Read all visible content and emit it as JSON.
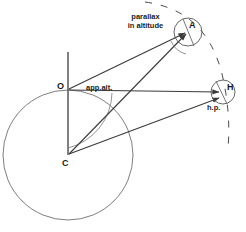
{
  "figure": {
    "background_color": "#ffffff",
    "stroke_color": "#3a3a3a",
    "circle_color": "#6b6b6b",
    "text_color": "#1a1a1a",
    "width": 246,
    "height": 232
  },
  "points": [
    {
      "id": "O",
      "label": "O",
      "x": 68,
      "y": 90,
      "label_x": 58,
      "label_y": 84,
      "description": "observer on earth surface"
    },
    {
      "id": "C",
      "label": "C",
      "x": 68,
      "y": 155,
      "label_x": 63,
      "label_y": 160,
      "description": "centre of the earth"
    },
    {
      "id": "A",
      "label": "A",
      "x": 188,
      "y": 32,
      "label_x": 190,
      "label_y": 22,
      "description": "body at apparent altitude"
    },
    {
      "id": "H",
      "label": "H",
      "x": 223,
      "y": 92,
      "label_x": 227,
      "label_y": 84,
      "description": "body on the horizon"
    }
  ],
  "annotations": [
    {
      "id": "parallax-in-altitude",
      "text_line_1": "parallax",
      "text_line_2": "in altitude",
      "x": 118,
      "y": 14,
      "width": 52
    },
    {
      "id": "app-alt",
      "text_line_1": "app.alt.",
      "text_line_2": "",
      "x": 86,
      "y": 84,
      "width": 36
    },
    {
      "id": "hp",
      "text_line_1": "h.p.",
      "text_line_2": "",
      "x": 208,
      "y": 104,
      "width": 20
    }
  ],
  "shapes": {
    "earth_circle": {
      "cx": 68,
      "cy": 155,
      "r": 65
    },
    "body_circle_a": {
      "cx": 188,
      "cy": 32,
      "r": 14
    },
    "body_circle_h": {
      "cx": 223,
      "cy": 92,
      "r": 12
    },
    "zenith_line": {
      "x1": 68,
      "y1": 52,
      "x2": 68,
      "y2": 90
    },
    "vertical_radius": {
      "x1": 68,
      "y1": 90,
      "x2": 68,
      "y2": 155
    }
  },
  "rays": [
    {
      "id": "ray-O-to-A",
      "from": "O",
      "to": "A",
      "arrow": true
    },
    {
      "id": "ray-C-to-A",
      "from": "C",
      "to": "A",
      "arrow": true
    },
    {
      "id": "ray-O-to-H",
      "from": "O",
      "to": "H",
      "arrow": true
    },
    {
      "id": "ray-C-to-H",
      "from": "C",
      "to": "H",
      "arrow": true
    }
  ],
  "arcs": [
    {
      "id": "app-alt-angle-arc",
      "at": "O",
      "radius": 58,
      "description": "angle arc marking apparent altitude at O"
    },
    {
      "id": "parallax-angle-arc",
      "at": "A",
      "radius": 22,
      "description": "small arc marking parallax angle at A"
    }
  ],
  "dashed_arc": {
    "id": "celestial-sphere-arc",
    "description": "dashed arc of the celestial sphere passing through A and H",
    "dash_pattern": "7 9"
  }
}
